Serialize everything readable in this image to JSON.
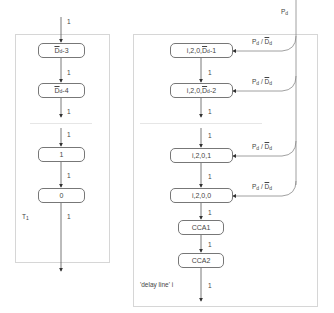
{
  "title_strip": "",
  "left_panel": {
    "name": "T1",
    "label_main": "T",
    "label_sub": "1",
    "input_rate": "1",
    "nodes": [
      {
        "id": "d-3",
        "prefix": "D",
        "overbar": true,
        "sub": "d",
        "suffix": "-3"
      },
      {
        "id": "d-4",
        "prefix": "D",
        "overbar": true,
        "sub": "d",
        "suffix": "-4"
      },
      {
        "id": "one",
        "text": "1"
      },
      {
        "id": "zero",
        "text": "0"
      }
    ],
    "edge_rates": [
      "1",
      "1",
      "1",
      "1",
      "1"
    ]
  },
  "right_panel": {
    "name": "'delay line' i",
    "input_label_main": "P",
    "input_label_sub": "d",
    "nodes": [
      {
        "id": "i20d-1",
        "prefix": "i,2,0,",
        "mid": "D",
        "sub": "d",
        "suffix": "-1"
      },
      {
        "id": "i20d-2",
        "prefix": "i,2,0,",
        "mid": "D",
        "sub": "d",
        "suffix": "-2"
      },
      {
        "id": "i201",
        "text": "i,2,0,1"
      },
      {
        "id": "i200",
        "text": "i,2,0,0"
      },
      {
        "id": "cca1",
        "text": "CCA1"
      },
      {
        "id": "cca2",
        "text": "CCA2"
      }
    ],
    "edge_rates": [
      "1",
      "1",
      "1",
      "1",
      "1",
      "1",
      "1"
    ],
    "feed_label": {
      "p": "P",
      "p_sub": "d",
      "slash": " / ",
      "d": "D",
      "d_sub": "d"
    }
  }
}
